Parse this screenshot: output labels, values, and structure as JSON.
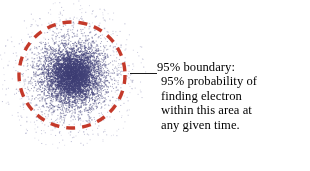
{
  "figure": {
    "title_visible": false,
    "background_color": "#ffffff",
    "canvas": {
      "width": 310,
      "height": 171
    }
  },
  "electron_cloud": {
    "name": "electron-probability-cloud",
    "center": {
      "x": 72,
      "y": 75
    },
    "dot_color": "#3b3b72",
    "dot_color_light": "#8e8eb8",
    "dot_count": 5200,
    "core_radius": 18,
    "spread_sigma": 26,
    "max_radius": 72,
    "dot_size": 1
  },
  "boundary_circle": {
    "name": "95-percent-boundary-circle",
    "color": "#c4392a",
    "center": {
      "x": 72,
      "y": 75
    },
    "radius": 53,
    "stroke_width": 3.4,
    "dash_pattern": "9 7",
    "style": "dashed"
  },
  "leader_line": {
    "name": "callout-leader-line",
    "color": "#1a1a1a",
    "x_start": 130,
    "x_end": 157,
    "y": 73,
    "stroke_width": 1
  },
  "annotation": {
    "name": "boundary-annotation",
    "color": "#000000",
    "lines": [
      "95% boundary:",
      "95% probability of",
      "finding electron",
      "within this area at",
      "any given time."
    ]
  },
  "chart_data": {
    "type": "scatter",
    "title": "",
    "subtitle": "",
    "xlabel": "",
    "ylabel": "",
    "grid": false,
    "legend_position": "none",
    "series": [
      {
        "name": "electron position samples",
        "color": "#3b3b72",
        "distribution": "radial-gaussian",
        "n_points": 5200,
        "center_x": 72,
        "center_y": 75,
        "sigma": 26
      }
    ],
    "annotations": [
      {
        "name": "95-percent-boundary",
        "shape": "dashed-circle",
        "center_x": 72,
        "center_y": 75,
        "radius": 53,
        "color": "#c4392a",
        "label": "95% boundary: 95% probability of finding electron within this area at any given time."
      }
    ]
  }
}
